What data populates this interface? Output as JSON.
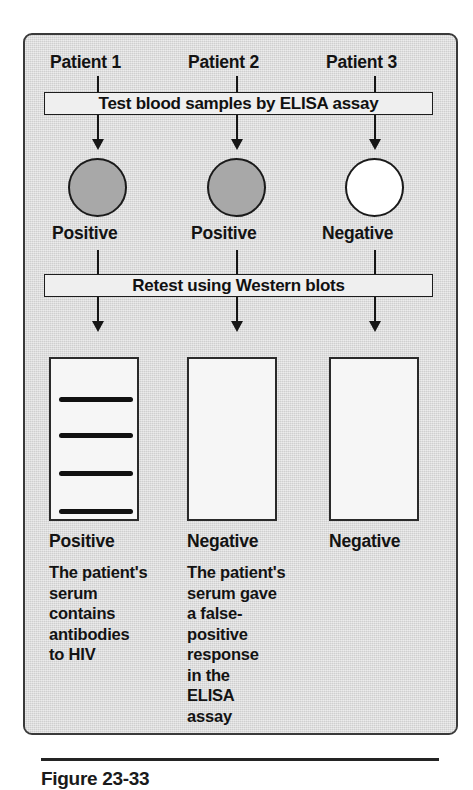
{
  "figure": {
    "caption": "Figure 23-33",
    "caption_visible_note": "cropped at bottom edge"
  },
  "columns": [
    {
      "patient_label": "Patient 1",
      "elisa_result": "Positive",
      "well_fill": "shaded",
      "blot_result": "Positive",
      "explanation": "The patient's\nserum\ncontains\nantibodies\nto HIV"
    },
    {
      "patient_label": "Patient 2",
      "elisa_result": "Positive",
      "well_fill": "shaded",
      "blot_result": "Negative",
      "explanation": "The patient's\nserum gave\na false-\npositive\nresponse\nin the\nELISA\nassay"
    },
    {
      "patient_label": "Patient 3",
      "elisa_result": "Negative",
      "well_fill": "white",
      "blot_result": "Negative",
      "explanation": ""
    }
  ],
  "steps": {
    "elisa": "Test blood samples by ELISA assay",
    "western": "Retest using Western blots"
  },
  "blot_bands": {
    "patient_1": [
      393,
      429,
      467,
      505
    ],
    "patient_2": [],
    "patient_3": []
  },
  "colors": {
    "panel_background": "#dcdcdc",
    "panel_border": "#3a3a3a",
    "bar_background": "#efefef",
    "bar_border": "#1d1d1d",
    "well_positive": "#a8a8a8",
    "well_negative": "#ffffff",
    "blot_background": "#f6f6f6",
    "blot_border": "#2a2a2a",
    "band": "#111111",
    "text": "#131313"
  }
}
